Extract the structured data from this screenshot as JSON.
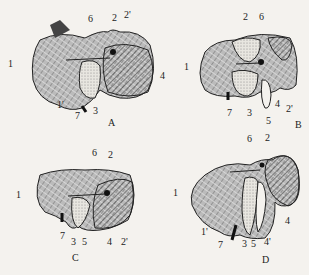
{
  "figure": {
    "panels": [
      {
        "id": "A",
        "caption": "A",
        "labels": [
          {
            "text": "1",
            "x": 8,
            "y": 64
          },
          {
            "text": "1'",
            "x": 57,
            "y": 104
          },
          {
            "text": "2",
            "x": 112,
            "y": 18
          },
          {
            "text": "2'",
            "x": 124,
            "y": 15
          },
          {
            "text": "3",
            "x": 93,
            "y": 111
          },
          {
            "text": "4",
            "x": 160,
            "y": 76
          },
          {
            "text": "6",
            "x": 88,
            "y": 19
          },
          {
            "text": "7",
            "x": 75,
            "y": 116
          }
        ]
      },
      {
        "id": "B",
        "caption": "B",
        "labels": [
          {
            "text": "1",
            "x": 184,
            "y": 67
          },
          {
            "text": "2",
            "x": 243,
            "y": 16
          },
          {
            "text": "2'",
            "x": 286,
            "y": 108
          },
          {
            "text": "3",
            "x": 247,
            "y": 112
          },
          {
            "text": "4",
            "x": 275,
            "y": 103
          },
          {
            "text": "5",
            "x": 266,
            "y": 120
          },
          {
            "text": "6",
            "x": 259,
            "y": 16
          },
          {
            "text": "7",
            "x": 227,
            "y": 112
          }
        ]
      },
      {
        "id": "C",
        "caption": "C",
        "labels": [
          {
            "text": "1",
            "x": 16,
            "y": 194
          },
          {
            "text": "2",
            "x": 108,
            "y": 154
          },
          {
            "text": "2'",
            "x": 121,
            "y": 241
          },
          {
            "text": "3",
            "x": 71,
            "y": 241
          },
          {
            "text": "4",
            "x": 107,
            "y": 241
          },
          {
            "text": "5",
            "x": 82,
            "y": 241
          },
          {
            "text": "6",
            "x": 92,
            "y": 152
          },
          {
            "text": "7",
            "x": 60,
            "y": 235
          }
        ]
      },
      {
        "id": "D",
        "caption": "D",
        "labels": [
          {
            "text": "1",
            "x": 173,
            "y": 192
          },
          {
            "text": "1'",
            "x": 201,
            "y": 231
          },
          {
            "text": "2",
            "x": 265,
            "y": 137
          },
          {
            "text": "3",
            "x": 242,
            "y": 243
          },
          {
            "text": "4",
            "x": 285,
            "y": 220
          },
          {
            "text": "4'",
            "x": 264,
            "y": 241
          },
          {
            "text": "5",
            "x": 251,
            "y": 243
          },
          {
            "text": "6",
            "x": 247,
            "y": 138
          },
          {
            "text": "7",
            "x": 218,
            "y": 244
          }
        ]
      }
    ],
    "captions": {
      "A": "A",
      "B": "B",
      "C": "C",
      "D": "D"
    }
  }
}
